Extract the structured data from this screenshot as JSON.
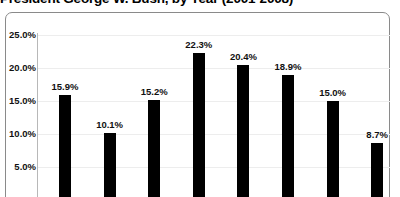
{
  "chart_data": {
    "type": "bar",
    "title": "President George W. Bush, by Year (2001-2008)",
    "xlabel": "",
    "ylabel": "",
    "categories": [
      "2001",
      "2002",
      "2003",
      "2004",
      "2005",
      "2006",
      "2007",
      "2008"
    ],
    "values": [
      15.9,
      10.1,
      15.2,
      22.3,
      20.4,
      18.9,
      15.0,
      8.7
    ],
    "data_labels": [
      "15.9%",
      "10.1%",
      "15.2%",
      "22.3%",
      "20.4%",
      "18.9%",
      "15.0%",
      "8.7%"
    ],
    "ylim": [
      0,
      27.5
    ],
    "yticks": [
      25.0,
      20.0,
      15.0,
      10.0,
      5.0
    ],
    "ytick_labels": [
      "25.0%",
      "20.0%",
      "15.0%",
      "10.0%",
      "5.0%"
    ],
    "grid": true,
    "legend": null,
    "bar_color": "#000000",
    "note_clipped": "title clipped at top edge; bar bases clipped at bottom edge"
  }
}
